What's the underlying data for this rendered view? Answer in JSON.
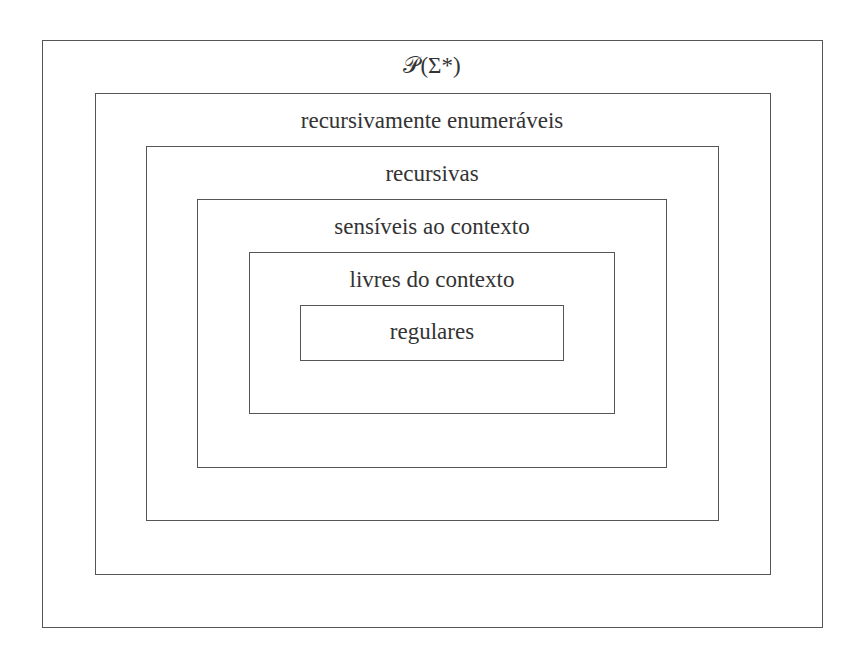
{
  "diagram": {
    "levels": [
      {
        "label": "𝒫(Σ*)"
      },
      {
        "label": "recursivamente enumeráveis"
      },
      {
        "label": "recursivas"
      },
      {
        "label": "sensíveis ao contexto"
      },
      {
        "label": "livres do contexto"
      },
      {
        "label": "regulares"
      }
    ],
    "colors": {
      "line": "#555555",
      "text": "#333333",
      "background": "#ffffff"
    }
  }
}
